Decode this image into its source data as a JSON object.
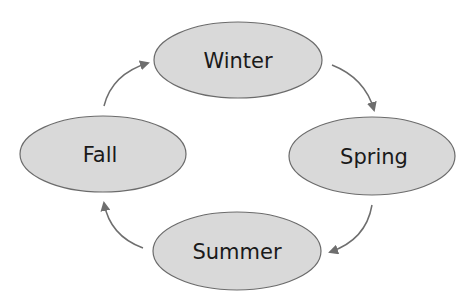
{
  "diagram": {
    "type": "cycle",
    "nodes": [
      {
        "id": "winter",
        "label": "Winter"
      },
      {
        "id": "spring",
        "label": "Spring"
      },
      {
        "id": "summer",
        "label": "Summer"
      },
      {
        "id": "fall",
        "label": "Fall"
      }
    ],
    "edges": [
      {
        "from": "winter",
        "to": "spring"
      },
      {
        "from": "spring",
        "to": "summer"
      },
      {
        "from": "summer",
        "to": "fall"
      },
      {
        "from": "fall",
        "to": "winter"
      }
    ],
    "colors": {
      "node_fill": "#d9d9d9",
      "node_stroke": "#6b6b6b",
      "arrow": "#6e6e6e",
      "text": "#1a1a1a"
    }
  }
}
